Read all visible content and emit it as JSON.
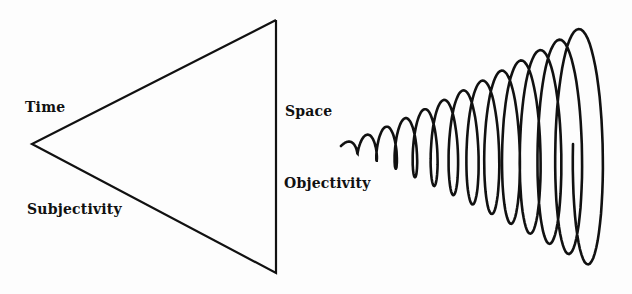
{
  "diagram": {
    "left_figure": {
      "shape": "triangle",
      "labels": {
        "upper_left": "Time",
        "lower_left": "Subjectivity",
        "upper_right": "Space",
        "lower_right": "Objectivity"
      }
    },
    "right_figure": {
      "shape": "expanding-spiral"
    },
    "colors": {
      "ink": "#111111",
      "background": "#fdfdfd"
    }
  }
}
